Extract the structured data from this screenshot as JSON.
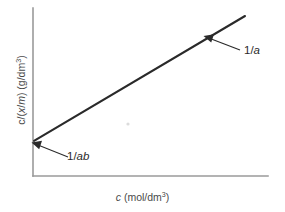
{
  "chart_data": {
    "type": "line",
    "title": "",
    "subtitle": "",
    "xlabel_plain": "c (mol/dm3)",
    "ylabel_plain": "c/(x/m) (g/dm3)",
    "xlabel_parts": {
      "symbol": "c",
      "open": " (mol/dm",
      "exponent": "3",
      "close": ")"
    },
    "ylabel_parts": {
      "lead": "c/(",
      "var_x": "x",
      "mid": "/",
      "var_m": "m",
      "tail": ") (g/dm",
      "exponent": "3",
      "close": ")"
    },
    "series": [
      {
        "name": "Langmuir linear plot",
        "points": [
          {
            "x": 0,
            "y": 0.22
          },
          {
            "x": 1,
            "y": 1.0
          }
        ],
        "color": "#2a2a2a",
        "style": "solid",
        "intercept_label": "1/ab",
        "slope_label": "1/a"
      }
    ],
    "annotations": [
      {
        "id": "slope",
        "text_prefix": "1/",
        "text_italic": "a",
        "meaning": "slope of the line equals 1/a",
        "arrow_from": {
          "x": 232,
          "y": 49
        },
        "arrow_to": {
          "x": 207,
          "y": 37
        }
      },
      {
        "id": "intercept",
        "text_prefix": "1/",
        "text_italic": "ab",
        "meaning": "y-intercept equals 1/ab",
        "arrow_from": {
          "x": 62,
          "y": 156
        },
        "arrow_to": {
          "x": 35,
          "y": 143
        }
      }
    ],
    "axes": {
      "x_axis": {
        "from": {
          "x": 33,
          "y": 176
        },
        "to": {
          "x": 268,
          "y": 176
        },
        "ticks": [],
        "tick_labels": [],
        "grid": false
      },
      "y_axis": {
        "from": {
          "x": 33,
          "y": 8
        },
        "to": {
          "x": 33,
          "y": 176
        },
        "ticks": [],
        "tick_labels": [],
        "grid": false
      },
      "axis_color": "#9a9a9a"
    },
    "legend": {
      "visible": false,
      "position": "none"
    },
    "grid": false
  },
  "colors": {
    "background": "#ffffff",
    "line": "#2a2a2a",
    "axis": "#9a9a9a",
    "text": "#2b2b2b",
    "label_text": "#4a4a4a"
  }
}
